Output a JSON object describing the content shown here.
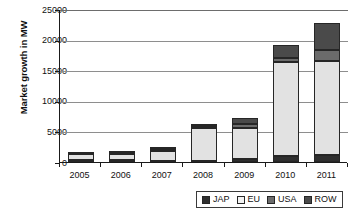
{
  "chart_data": {
    "type": "bar",
    "stacked": true,
    "title": "",
    "xlabel": "",
    "ylabel": "Market growth in MW",
    "categories": [
      "2005",
      "2006",
      "2007",
      "2008",
      "2009",
      "2010",
      "2011"
    ],
    "ylim": [
      0,
      25000
    ],
    "ytick_labels": [
      "0",
      "5000",
      "10000",
      "15000",
      "20000",
      "25000"
    ],
    "ytick_values": [
      0,
      5000,
      10000,
      15000,
      20000,
      25000
    ],
    "grid": true,
    "legend_position": "bottom-right",
    "series": [
      {
        "name": "JAP",
        "color": "#2f2f2f",
        "values": [
          290,
          290,
          210,
          230,
          480,
          990,
          1100
        ]
      },
      {
        "name": "EU",
        "color": "#e2e2e2",
        "values": [
          1000,
          1050,
          1600,
          5350,
          5100,
          15300,
          15400
        ]
      },
      {
        "name": "USA",
        "color": "#6b6b6b",
        "values": [
          60,
          80,
          300,
          250,
          650,
          700,
          1750
        ]
      },
      {
        "name": "ROW",
        "color": "#4a4a4a",
        "values": [
          110,
          180,
          390,
          270,
          970,
          2150,
          4450
        ]
      }
    ],
    "totals": [
      1460,
      1600,
      2500,
      6100,
      7200,
      19140,
      22700
    ]
  },
  "legend": {
    "items": [
      {
        "label": "JAP",
        "swatch": "#2f2f2f"
      },
      {
        "label": "EU",
        "swatch": "#f2f2f2"
      },
      {
        "label": "USA",
        "swatch": "#6b6b6b"
      },
      {
        "label": "ROW",
        "swatch": "#4a4a4a"
      }
    ]
  }
}
